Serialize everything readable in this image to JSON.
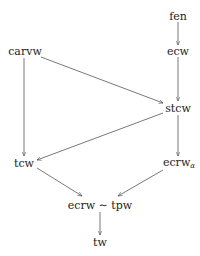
{
  "diagram": {
    "type": "directed-graph",
    "nodes": {
      "fen": {
        "label": "fen",
        "x": 178,
        "y": 16
      },
      "ecw": {
        "label": "ecw",
        "x": 178,
        "y": 51
      },
      "carvw": {
        "label": "carvw",
        "x": 25,
        "y": 51
      },
      "stcw": {
        "label": "stcw",
        "x": 178,
        "y": 108
      },
      "tcw": {
        "label": "tcw",
        "x": 24,
        "y": 163
      },
      "ecrw_alpha": {
        "label": "ecrw",
        "subscript": "α",
        "x": 178,
        "y": 163
      },
      "ecrw_tpw": {
        "label": "ecrw ∼ tpw",
        "x": 100,
        "y": 205
      },
      "tw": {
        "label": "tw",
        "x": 100,
        "y": 242
      }
    },
    "edges": [
      {
        "from": "fen",
        "to": "ecw"
      },
      {
        "from": "ecw",
        "to": "stcw"
      },
      {
        "from": "carvw",
        "to": "stcw"
      },
      {
        "from": "carvw",
        "to": "tcw"
      },
      {
        "from": "stcw",
        "to": "tcw"
      },
      {
        "from": "stcw",
        "to": "ecrw_alpha"
      },
      {
        "from": "tcw",
        "to": "ecrw_tpw"
      },
      {
        "from": "ecrw_alpha",
        "to": "ecrw_tpw"
      },
      {
        "from": "ecrw_tpw",
        "to": "tw"
      }
    ],
    "colors": {
      "text": "#222222",
      "edge": "#555555",
      "background": "#ffffff"
    }
  }
}
